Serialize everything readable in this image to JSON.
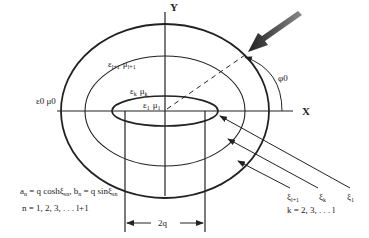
{
  "figure": {
    "axes": {
      "x_label": "X",
      "y_label": "Y"
    },
    "regions": {
      "outer_medium": "ε0 μ0",
      "layer_outer": {
        "eps": "ε",
        "eps_sub": "l+1",
        "mu": "μ",
        "mu_sub": "l+1"
      },
      "layer_k": {
        "eps": "ε",
        "eps_sub": "k",
        "mu": "μ",
        "mu_sub": "k"
      },
      "core": {
        "eps": "ε",
        "eps_sub": "1",
        "mu": "μ",
        "mu_sub": "1"
      }
    },
    "incidence_angle": "φ0",
    "interfocal_distance": "2q",
    "boundary_labels": [
      {
        "sym": "ξ",
        "sub": "l+1"
      },
      {
        "sym": "ξ",
        "sub": "k"
      },
      {
        "sym": "ξ",
        "sub": "1"
      }
    ],
    "k_range": "k = 2, 3, . . .  l",
    "equation_line1": "an = q coshξsn, bn = q sinξsn",
    "equation_parts": {
      "a": "a",
      "a_sub": "n",
      "eq1": " = q cosh",
      "xi1": "ξ",
      "xi1_sub": "sn",
      "sep": ", ",
      "b": "b",
      "b_sub": "n",
      "eq2": " = q sin",
      "xi2": "ξ",
      "xi2_sub": "sn"
    },
    "n_range": "n = 1, 2, 3, . . .   l+1",
    "colors": {
      "ink": "#222222",
      "background": "#ffffff",
      "arrow_fill": "#555555"
    }
  }
}
